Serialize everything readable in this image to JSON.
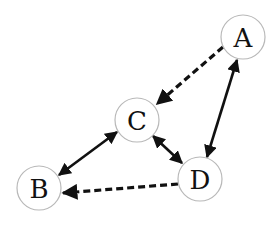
{
  "diagram": {
    "type": "directed-graph",
    "nodes": [
      {
        "id": "A",
        "label": "A",
        "x": 243,
        "y": 37
      },
      {
        "id": "B",
        "label": "B",
        "x": 39,
        "y": 188
      },
      {
        "id": "C",
        "label": "C",
        "x": 137,
        "y": 120
      },
      {
        "id": "D",
        "label": "D",
        "x": 200,
        "y": 179
      }
    ],
    "edges": [
      {
        "from": "A",
        "to": "C",
        "style": "dashed",
        "direction": "forward"
      },
      {
        "from": "A",
        "to": "D",
        "style": "solid",
        "direction": "both"
      },
      {
        "from": "C",
        "to": "B",
        "style": "solid",
        "direction": "both"
      },
      {
        "from": "C",
        "to": "D",
        "style": "solid",
        "direction": "both"
      },
      {
        "from": "D",
        "to": "B",
        "style": "dashed",
        "direction": "forward"
      }
    ],
    "colors": {
      "edge": "#111111",
      "node_border": "#b8b8b8",
      "node_fill": "#ffffff"
    }
  }
}
